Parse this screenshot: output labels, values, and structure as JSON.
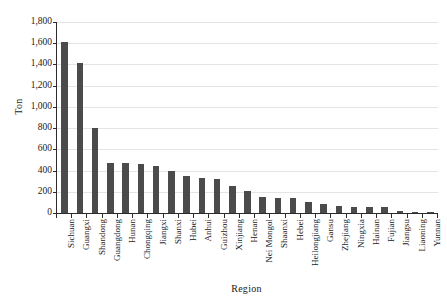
{
  "chart_data": {
    "type": "bar",
    "title": "",
    "xlabel": "Region",
    "ylabel": "Ton",
    "ylim": [
      0,
      1800
    ],
    "ytick_values": [
      0,
      200,
      400,
      600,
      800,
      1000,
      1200,
      1400,
      1600,
      1800
    ],
    "ytick_labels": [
      "0",
      "200",
      "400",
      "600",
      "800",
      "1,000",
      "1,200",
      "1,400",
      "1,600",
      "1,800"
    ],
    "grid": "horizontal",
    "legend": "none",
    "bar_color": "#4b4b4b",
    "categories": [
      "Sichuan",
      "Guangxi",
      "Shandong",
      "Guangdong",
      "Hunan",
      "Chongqing",
      "Jiangxi",
      "Shanxi",
      "Hubei",
      "Anhui",
      "Guizhou",
      "Xinjiang",
      "Henan",
      "Nei Mongol",
      "Shaanxi",
      "Hebei",
      "Heilongjiang",
      "Gansu",
      "Zhejiang",
      "Ningxia",
      "Hainan",
      "Fujian",
      "Jiangsu",
      "Liaoning",
      "Yunnan"
    ],
    "values": [
      1615,
      1410,
      800,
      475,
      475,
      460,
      440,
      393,
      345,
      330,
      317,
      258,
      207,
      152,
      145,
      138,
      105,
      82,
      68,
      58,
      55,
      58,
      18,
      2,
      1
    ]
  }
}
